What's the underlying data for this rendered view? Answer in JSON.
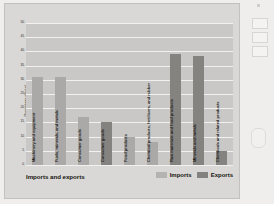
{
  "chart_data": {
    "type": "bar",
    "title": "",
    "xlabel": "Imports and exports",
    "ylabel": "Percentage of total",
    "ylim": [
      0,
      50
    ],
    "ytick_labels": [
      "50",
      "45",
      "40",
      "35",
      "30",
      "25",
      "20",
      "15",
      "10",
      "5",
      "0"
    ],
    "ytick_values": [
      50,
      45,
      40,
      35,
      30,
      25,
      20,
      15,
      10,
      5,
      0
    ],
    "grid": true,
    "legend_position": "bottom-right",
    "legend": [
      "Imports",
      "Exports"
    ],
    "colors": {
      "imports": "#aaa9a7",
      "exports": "#85837f",
      "plot_background": "#c9c8c6",
      "figure_background": "#d9d8d6",
      "gridline": "#f2f1ef"
    },
    "categories": [
      "Machinery and equipment",
      "Fuels, minerals, and metals",
      "Consumer goods",
      "Consumer goods",
      "Food products",
      "Chemical products, fertilisers, and rubber",
      "Raw materials and food products",
      "Minerals and metals",
      "Chemicals and related products"
    ],
    "bars": [
      {
        "label": "Machinery and equipment",
        "series": "Imports",
        "value": 31
      },
      {
        "label": "Fuels, minerals, and metals",
        "series": "Imports",
        "value": 31
      },
      {
        "label": "Consumer goods",
        "series": "Imports",
        "value": 17
      },
      {
        "label": "Consumer goods",
        "series": "Exports",
        "value": 15
      },
      {
        "label": "Food products",
        "series": "Imports",
        "value": 10
      },
      {
        "label": "Chemical products, fertilisers, and rubber",
        "series": "Imports",
        "value": 8
      },
      {
        "label": "Raw materials and food products",
        "series": "Exports",
        "value": 39
      },
      {
        "label": "Minerals and metals",
        "series": "Exports",
        "value": 38.5
      },
      {
        "label": "Chemicals and related products",
        "series": "Exports",
        "value": 5
      }
    ],
    "series": [
      {
        "name": "Imports",
        "values": [
          31,
          31,
          17,
          null,
          10,
          8,
          null,
          null,
          null
        ]
      },
      {
        "name": "Exports",
        "values": [
          null,
          null,
          null,
          15,
          null,
          null,
          39,
          38.5,
          5
        ]
      }
    ]
  },
  "footer": {
    "x_title": "Imports and exports",
    "legend_imports": "Imports",
    "legend_exports": "Exports"
  }
}
